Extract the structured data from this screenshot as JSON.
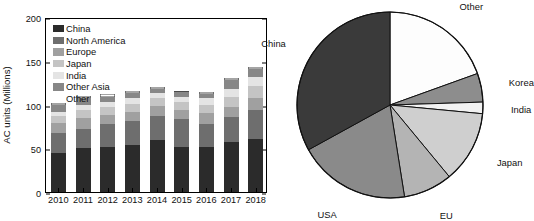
{
  "chart_data": [
    {
      "type": "bar",
      "id": "ac-units-stacked-bar",
      "title": "",
      "xlabel": "",
      "ylabel": "AC units (Millions)",
      "ylim": [
        0,
        200
      ],
      "yticks": [
        0,
        50,
        100,
        150,
        200
      ],
      "grid": false,
      "stacked": true,
      "legend_position": "inside-top-left",
      "categories": [
        "2010",
        "2011",
        "2012",
        "2013",
        "2014",
        "2015",
        "2016",
        "2017",
        "2018"
      ],
      "series": [
        {
          "name": "China",
          "color": "#2b2b2b",
          "values": [
            45,
            50,
            52,
            54,
            59,
            51,
            52,
            57,
            61
          ]
        },
        {
          "name": "North America",
          "color": "#6e6e6e",
          "values": [
            23,
            22,
            26,
            27,
            28,
            32,
            26,
            29,
            33
          ]
        },
        {
          "name": "Europe",
          "color": "#a0a0a0",
          "values": [
            11,
            13,
            10,
            11,
            11,
            11,
            12,
            11,
            13
          ]
        },
        {
          "name": "Japan",
          "color": "#c4c4c4",
          "values": [
            8,
            9,
            9,
            9,
            9,
            9,
            10,
            12,
            14
          ]
        },
        {
          "name": "India",
          "color": "#e4e4e4",
          "values": [
            5,
            6,
            6,
            6,
            6,
            6,
            7,
            9,
            10
          ]
        },
        {
          "name": "Other Asia",
          "color": "#878787",
          "values": [
            7,
            7,
            6,
            6,
            5,
            5,
            5,
            10,
            10
          ]
        },
        {
          "name": "Other",
          "color": "#ffffff",
          "values": [
            3,
            3,
            3,
            3,
            2,
            2,
            2,
            2,
            2
          ]
        }
      ],
      "totals": [
        102,
        110,
        112,
        116,
        120,
        116,
        114,
        130,
        143
      ]
    },
    {
      "type": "pie",
      "id": "ac-market-share-pie",
      "title": "",
      "start_angle_deg": 0,
      "direction": "clockwise",
      "labels": [
        "Other",
        "Korea",
        "India",
        "Japan",
        "EU",
        "USA",
        "China"
      ],
      "values": [
        19.5,
        5.0,
        2.0,
        12.5,
        8.5,
        19.5,
        33.0
      ],
      "colors": [
        "#fdfdfd",
        "#8d8d8d",
        "#f2f2f2",
        "#cfcfcf",
        "#b4b4b4",
        "#8a8a8a",
        "#3a3a3a"
      ],
      "label_positions": [
        "outside-top-right",
        "outside-right",
        "outside-right",
        "outside-right",
        "outside-bottom-right",
        "outside-bottom",
        "outside-left"
      ]
    }
  ],
  "bar": {
    "ylabel": "AC units (Millions)",
    "yticks": [
      "0",
      "50",
      "100",
      "150",
      "200"
    ],
    "xticks": [
      "2010",
      "2011",
      "2012",
      "2013",
      "2014",
      "2015",
      "2016",
      "2017",
      "2018"
    ],
    "legend": [
      {
        "label": "China",
        "swatch": "#2b2b2b"
      },
      {
        "label": "North America",
        "swatch": "#6e6e6e"
      },
      {
        "label": "Europe",
        "swatch": "#a0a0a0"
      },
      {
        "label": "Japan",
        "swatch": "#c4c4c4"
      },
      {
        "label": "India",
        "swatch": "#e4e4e4"
      },
      {
        "label": "Other Asia",
        "swatch": "#878787"
      },
      {
        "label": "Other",
        "swatch": "none"
      }
    ]
  },
  "pie": {
    "labels": {
      "other": "Other",
      "korea": "Korea",
      "india": "India",
      "japan": "Japan",
      "eu": "EU",
      "usa": "USA",
      "china": "China"
    }
  }
}
